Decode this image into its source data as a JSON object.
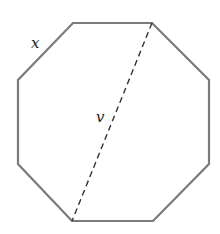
{
  "diagram": {
    "shape": "regular octagon",
    "vertices": [
      [
        73,
        23
      ],
      [
        152,
        23
      ],
      [
        209,
        80
      ],
      [
        209,
        164
      ],
      [
        153,
        221
      ],
      [
        72,
        221
      ],
      [
        18,
        164
      ],
      [
        18,
        80
      ]
    ],
    "outline_color": "#7a7a7a",
    "diagonal": {
      "from": [
        152,
        23
      ],
      "to": [
        72,
        221
      ],
      "style": "dashed",
      "color": "#333333"
    },
    "labels": {
      "side": "x",
      "diagonal": "v"
    }
  }
}
